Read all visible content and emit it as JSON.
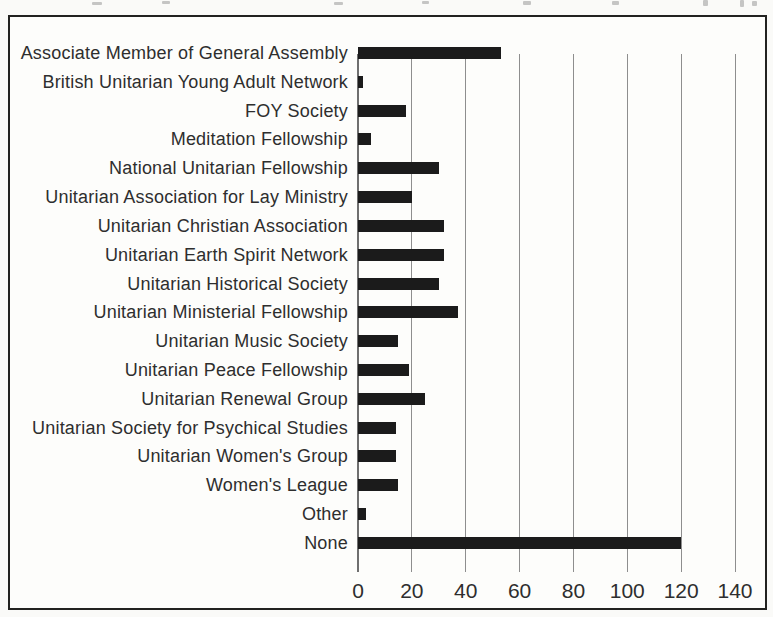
{
  "figure": {
    "kind": "scanned book figure",
    "frame_color": "#222220",
    "paper_color": "#fafaf8"
  },
  "chart_data": {
    "type": "bar",
    "orientation": "horizontal",
    "title": "",
    "xlabel": "",
    "ylabel": "",
    "xlim": [
      0,
      140
    ],
    "x_ticks": [
      0,
      20,
      40,
      60,
      80,
      100,
      120,
      140
    ],
    "grid": "vertical gridlines at every x tick, drawn behind bars",
    "legend": "none",
    "bar_color": "#1b1b1b",
    "gridline_color": "#8e8e8e",
    "text_color": "#2e2e2e",
    "categories": [
      "Associate Member of General Assembly",
      "British Unitarian Young Adult Network",
      "FOY Society",
      "Meditation Fellowship",
      "National Unitarian Fellowship",
      "Unitarian Association for Lay Ministry",
      "Unitarian Christian Association",
      "Unitarian Earth Spirit Network",
      "Unitarian Historical Society",
      "Unitarian Ministerial Fellowship",
      "Unitarian Music Society",
      "Unitarian Peace Fellowship",
      "Unitarian Renewal Group",
      "Unitarian Society for Psychical Studies",
      "Unitarian Women's Group",
      "Women's League",
      "Other",
      "None"
    ],
    "values": [
      53,
      2,
      18,
      5,
      30,
      20,
      32,
      32,
      30,
      37,
      15,
      19,
      25,
      14,
      14,
      15,
      3,
      120
    ]
  }
}
